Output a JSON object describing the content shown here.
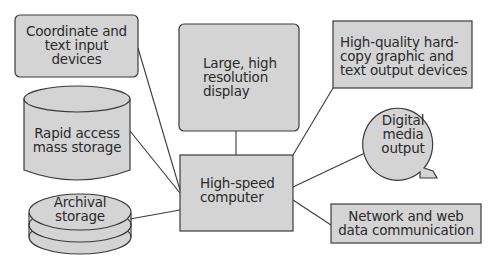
{
  "diagram": {
    "colors": {
      "fill": "#d4d4d4",
      "stroke": "#3a3a3a",
      "text": "#2a2a2a",
      "background": "#ffffff"
    },
    "nodes": {
      "input": {
        "label": "Coordinate and\ntext input\ndevices",
        "shape": "rounded-rect"
      },
      "display": {
        "label": "Large, high\nresolution\ndisplay",
        "shape": "rounded-rect"
      },
      "hardcopy": {
        "label": "High-quality hard-\ncopy graphic and\ntext output devices",
        "shape": "rect"
      },
      "mass_storage": {
        "label": "Rapid access\nmass storage",
        "shape": "cylinder"
      },
      "digital_media": {
        "label": "Digital\nmedia\noutput",
        "shape": "speech-bubble"
      },
      "computer": {
        "label": "High-speed\ncomputer",
        "shape": "rect"
      },
      "archival": {
        "label": "Archival\nstorage",
        "shape": "disk-stack"
      },
      "network": {
        "label": "Network and web\ndata communication",
        "shape": "rect"
      }
    },
    "edges": [
      {
        "from": "input",
        "to": "computer"
      },
      {
        "from": "display",
        "to": "computer"
      },
      {
        "from": "hardcopy",
        "to": "computer"
      },
      {
        "from": "mass_storage",
        "to": "computer"
      },
      {
        "from": "digital_media",
        "to": "computer"
      },
      {
        "from": "archival",
        "to": "computer"
      },
      {
        "from": "network",
        "to": "computer"
      }
    ]
  }
}
